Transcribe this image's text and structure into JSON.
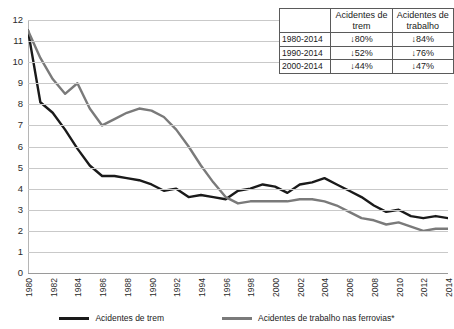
{
  "chart_data": {
    "type": "line",
    "title": "",
    "xlabel": "",
    "ylabel": "",
    "ylim": [
      0,
      12
    ],
    "ytick_step": 1,
    "grid": true,
    "legend_position": "bottom",
    "x": [
      1980,
      1981,
      1982,
      1983,
      1984,
      1985,
      1986,
      1987,
      1988,
      1989,
      1990,
      1991,
      1992,
      1993,
      1994,
      1995,
      1996,
      1997,
      1998,
      1999,
      2000,
      2001,
      2002,
      2003,
      2004,
      2005,
      2006,
      2007,
      2008,
      2009,
      2010,
      2011,
      2012,
      2013,
      2014
    ],
    "xtick_labels": [
      "1980",
      "1982",
      "1984",
      "1986",
      "1988",
      "1990",
      "1992",
      "1994",
      "1996",
      "1998",
      "2000",
      "2002",
      "2004",
      "2006",
      "2008",
      "2010",
      "2012",
      "2014"
    ],
    "ytick_labels": [
      "0",
      "1",
      "2",
      "3",
      "4",
      "5",
      "6",
      "7",
      "8",
      "9",
      "10",
      "11",
      "12"
    ],
    "series": [
      {
        "name": "Acidentes de trem",
        "color": "#1a1a1a",
        "values": [
          11.5,
          8.1,
          7.6,
          6.8,
          5.9,
          5.1,
          4.6,
          4.6,
          4.5,
          4.4,
          4.2,
          3.9,
          4.0,
          3.6,
          3.7,
          3.6,
          3.5,
          3.9,
          4.0,
          4.2,
          4.1,
          3.8,
          4.2,
          4.3,
          4.5,
          4.2,
          3.9,
          3.6,
          3.2,
          2.9,
          3.0,
          2.7,
          2.6,
          2.7,
          2.6
        ]
      },
      {
        "name": "Acidentes de trabalho nas ferrovias*",
        "color": "#7a7a7a",
        "values": [
          11.5,
          10.2,
          9.2,
          8.5,
          9.0,
          7.8,
          7.0,
          7.3,
          7.6,
          7.8,
          7.7,
          7.4,
          6.8,
          6.0,
          5.1,
          4.3,
          3.6,
          3.3,
          3.4,
          3.4,
          3.4,
          3.4,
          3.5,
          3.5,
          3.4,
          3.2,
          2.9,
          2.6,
          2.5,
          2.3,
          2.4,
          2.2,
          2.0,
          2.1,
          2.1
        ]
      }
    ]
  },
  "summary_table": {
    "corner": "",
    "columns": [
      "Acidentes de trem",
      "Acidentes de trabalho"
    ],
    "rows": [
      {
        "period": "1980-2014",
        "trem": "↓80%",
        "trabalho": "↓84%"
      },
      {
        "period": "1990-2014",
        "trem": "↓52%",
        "trabalho": "↓76%"
      },
      {
        "period": "2000-2014",
        "trem": "↓44%",
        "trabalho": "↓47%"
      }
    ]
  },
  "legend": {
    "items": [
      {
        "label": "Acidentes de trem",
        "color": "#1a1a1a"
      },
      {
        "label": "Acidentes de trabalho nas ferrovias*",
        "color": "#7a7a7a"
      }
    ]
  }
}
